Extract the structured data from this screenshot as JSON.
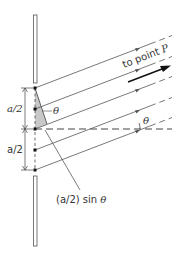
{
  "figure": {
    "type": "single-slit diffraction geometry",
    "labels": {
      "to_point": "to point ",
      "point_name": "P",
      "theta_upper": "θ",
      "theta_lower": "θ",
      "half_width_top": "a/2",
      "half_width_bottom": "a/2",
      "path_diff_prefix": "(a/2) sin ",
      "path_diff_theta": "θ"
    },
    "colors": {
      "line": "#555555",
      "shade": "#c8c8c8",
      "dot": "#111111",
      "arrow": "#111111",
      "text": "#333333"
    },
    "slit": {
      "dots_y": [
        88,
        109,
        129,
        150,
        170
      ],
      "x": 35
    },
    "ray_angle_deg": 21
  }
}
